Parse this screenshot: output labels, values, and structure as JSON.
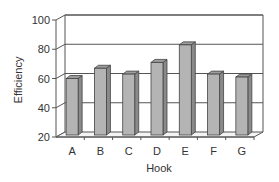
{
  "chart_data": {
    "type": "bar",
    "title": "",
    "xlabel": "Hook",
    "ylabel": "Efficiency",
    "categories": [
      "A",
      "B",
      "C",
      "D",
      "E",
      "F",
      "G"
    ],
    "values": [
      60,
      67,
      63,
      71,
      83,
      63,
      61
    ],
    "ylim": [
      20,
      100
    ],
    "yticks": [
      "20",
      "40",
      "60",
      "80",
      "100"
    ],
    "grid": true,
    "legend": "none",
    "style": "3d-column",
    "bar_color": "#b4b4b4"
  }
}
